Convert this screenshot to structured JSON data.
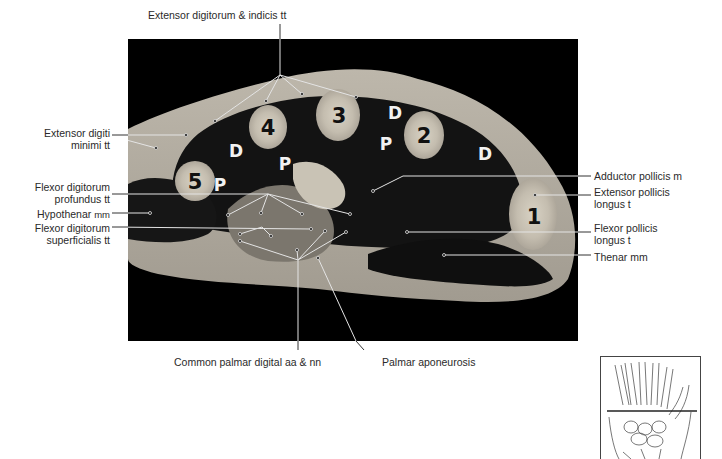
{
  "figure": {
    "title_label": "Extensor digitorum & indicis tt",
    "left_labels": {
      "edm_1": "Extensor digiti",
      "edm_2": "minimi tt",
      "fdp_1": "Flexor digitorum",
      "fdp_2": "profundus tt",
      "hypothenar_a": "Hypothenar",
      "hypothenar_b": "mm",
      "fds_1": "Flexor digitorum",
      "fds_2": "superficialis tt"
    },
    "right_labels": {
      "adductor": "Adductor pollicis m",
      "epl_1": "Extensor pollicis",
      "epl_2": "longus t",
      "fpl_1": "Flexor pollicis",
      "fpl_2": "longus t",
      "thenar": "Thenar mm"
    },
    "bottom_labels": {
      "common": "Common palmar digital aa & nn",
      "palmar": "Palmar aponeurosis"
    },
    "metacarpal_numbers": [
      "1",
      "2",
      "3",
      "4",
      "5"
    ],
    "interosseous_marks": {
      "dorsal": "D",
      "palmar": "P"
    },
    "colors": {
      "background": "#000000",
      "tissue": "#b8b2a6",
      "muscle": "#121212",
      "bone": "#c9c2b4",
      "leader": "#e8e8e8"
    }
  }
}
